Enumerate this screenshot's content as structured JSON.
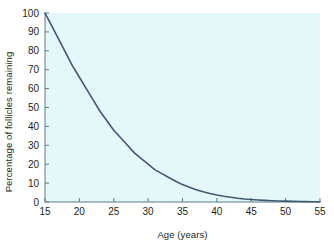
{
  "chart_data": {
    "type": "line",
    "title": "",
    "xlabel": "Age (years)",
    "ylabel": "Percentage of follicles remaining",
    "xlim": [
      15,
      55
    ],
    "ylim": [
      0,
      100
    ],
    "xticks": [
      15,
      20,
      25,
      30,
      35,
      40,
      45,
      50,
      55
    ],
    "yticks": [
      0,
      10,
      20,
      30,
      40,
      50,
      60,
      70,
      80,
      90,
      100
    ],
    "xtick_labels": [
      "15",
      "20",
      "25",
      "30",
      "35",
      "40",
      "45",
      "50",
      "55"
    ],
    "ytick_labels": [
      "0",
      "10",
      "20",
      "30",
      "40",
      "50",
      "60",
      "70",
      "80",
      "90",
      "100"
    ],
    "grid": false,
    "legend": null,
    "legend_position": "none",
    "series": [
      {
        "name": "Percentage of follicles remaining",
        "color": "#3d5a73",
        "x": [
          15,
          16,
          17,
          18,
          19,
          20,
          21,
          22,
          23,
          24,
          25,
          26,
          27,
          28,
          29,
          30,
          31,
          32,
          33,
          34,
          35,
          36,
          37,
          38,
          39,
          40,
          41,
          42,
          43,
          44,
          45,
          46,
          47,
          48,
          49,
          50,
          51,
          52,
          53,
          54,
          55
        ],
        "values": [
          100,
          93,
          86,
          79,
          72,
          66,
          60,
          54,
          48,
          43,
          38,
          34,
          30,
          26,
          23,
          20,
          17,
          15,
          13,
          11,
          9.2,
          7.8,
          6.5,
          5.4,
          4.5,
          3.7,
          3.0,
          2.5,
          2.0,
          1.6,
          1.3,
          1.05,
          0.85,
          0.68,
          0.55,
          0.44,
          0.35,
          0.28,
          0.22,
          0.17,
          0.12
        ]
      }
    ]
  },
  "figure": {
    "background_color": "#e6f7f9",
    "axis_color": "#5a7a8a",
    "text_color": "#231f20"
  }
}
